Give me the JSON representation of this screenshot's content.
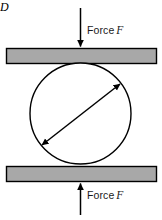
{
  "figure": {
    "background_color": "#ffffff",
    "line_color": "#000000",
    "plate_fill_color": "#a8a8a8",
    "circle_fill_color": "#ffffff",
    "text_color": "#1a1a1a"
  },
  "labels": {
    "force_top": {
      "text": "Force",
      "symbol": "F"
    },
    "force_bottom": {
      "text": "Force",
      "symbol": "F"
    },
    "diameter": {
      "symbol": "D"
    }
  },
  "geometry": {
    "canvas": {
      "width": 162,
      "height": 220
    },
    "top_plate": {
      "x": 6,
      "y": 48,
      "width": 151,
      "height": 16
    },
    "bottom_plate": {
      "x": 6,
      "y": 166,
      "width": 151,
      "height": 16
    },
    "circle": {
      "cx": 80.5,
      "cy": 113.5,
      "r": 50.5
    },
    "top_force_arrow": {
      "x": 80.5,
      "y_start": 8,
      "y_end": 47,
      "direction": "down"
    },
    "bottom_force_arrow": {
      "x": 80.5,
      "y_start": 215,
      "y_end": 184,
      "direction": "up"
    },
    "diameter_arrow": {
      "x1": 42,
      "y1": 145,
      "x2": 120,
      "y2": 84,
      "direction": "both"
    }
  },
  "icon_names": {
    "top_force_arrow": "arrow-down-icon",
    "bottom_force_arrow": "arrow-up-icon",
    "diameter_arrow": "double-headed-arrow-icon"
  }
}
